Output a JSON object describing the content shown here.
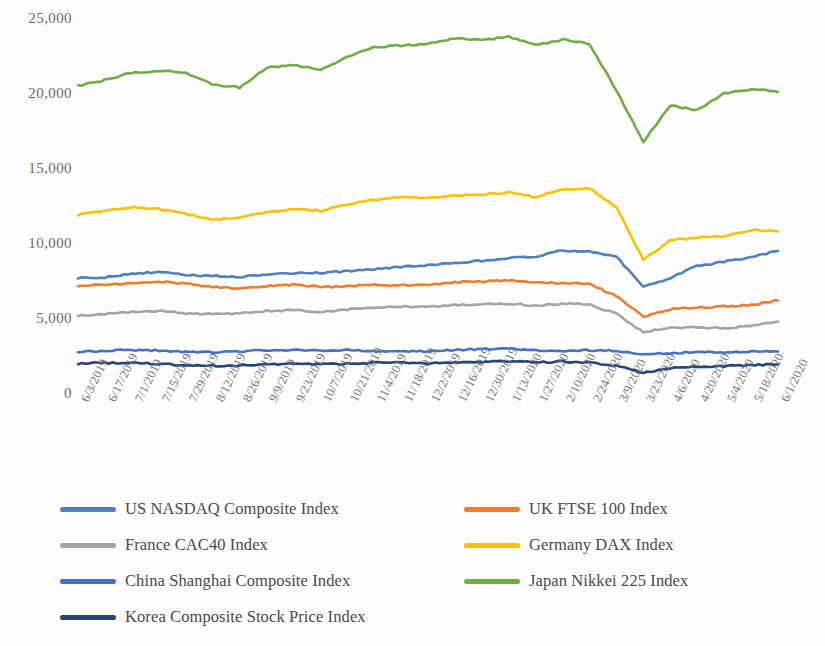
{
  "chart_data": {
    "type": "line",
    "title": "",
    "xlabel": "",
    "ylabel": "",
    "ylim": [
      0,
      25000
    ],
    "yticks": [
      0,
      5000,
      10000,
      15000,
      20000,
      25000
    ],
    "ytick_labels": [
      "0",
      "5,000",
      "10,000",
      "15,000",
      "20,000",
      "25,000"
    ],
    "grid": false,
    "legend_position": "bottom",
    "x": [
      "6/3/2019",
      "6/17/2019",
      "7/1/2019",
      "7/15/2019",
      "7/29/2019",
      "8/12/2019",
      "8/26/2019",
      "9/9/2019",
      "9/23/2019",
      "10/7/2019",
      "10/21/2019",
      "11/4/2019",
      "11/18/2019",
      "12/2/2019",
      "12/16/2019",
      "12/30/2019",
      "1/13/2020",
      "1/27/2020",
      "2/10/2020",
      "2/24/2020",
      "3/9/2020",
      "3/23/2020",
      "4/6/2020",
      "4/20/2020",
      "5/4/2020",
      "5/18/2020",
      "6/1/2020"
    ],
    "xtick_labels": [
      "6/3/2019",
      "6/17/2019",
      "7/1/2019",
      "7/15/2019",
      "7/29/2019",
      "8/12/2019",
      "8/26/2019",
      "9/9/2019",
      "9/23/2019",
      "10/7/2019",
      "10/21/2019",
      "11/4/2019",
      "11/18/2019",
      "12/2/2019",
      "12/16/2019",
      "12/30/2019",
      "1/13/2020",
      "1/27/2020",
      "2/10/2020",
      "2/24/2020",
      "3/9/2020",
      "3/23/2020",
      "4/6/2020",
      "4/20/2020",
      "5/4/2020",
      "5/18/2020",
      "6/1/2020"
    ],
    "series": [
      {
        "name": "US NASDAQ Composite Index",
        "color": "#4E81BD",
        "values": [
          7800,
          7850,
          8100,
          8200,
          8000,
          7950,
          7880,
          8050,
          8100,
          8150,
          8250,
          8400,
          8550,
          8650,
          8800,
          8950,
          9150,
          9200,
          9650,
          9550,
          9200,
          7200,
          7800,
          8600,
          8900,
          9200,
          9600
        ]
      },
      {
        "name": "UK FTSE 100 Index",
        "color": "#ED7D31",
        "values": [
          7300,
          7350,
          7450,
          7550,
          7450,
          7200,
          7100,
          7250,
          7350,
          7200,
          7250,
          7350,
          7300,
          7350,
          7520,
          7580,
          7620,
          7500,
          7450,
          7400,
          6600,
          5200,
          5700,
          5850,
          5900,
          6000,
          6300
        ]
      },
      {
        "name": "France CAC40 Index",
        "color": "#A5A5A5",
        "values": [
          5300,
          5400,
          5550,
          5600,
          5450,
          5380,
          5450,
          5600,
          5650,
          5550,
          5700,
          5850,
          5900,
          5880,
          6000,
          6050,
          6100,
          5950,
          6100,
          6050,
          5400,
          4200,
          4500,
          4500,
          4450,
          4600,
          4900
        ]
      },
      {
        "name": "Germany DAX Index",
        "color": "#FFC000",
        "values": [
          12000,
          12300,
          12500,
          12400,
          12100,
          11700,
          11800,
          12200,
          12400,
          12300,
          12700,
          13000,
          13200,
          13100,
          13300,
          13350,
          13500,
          13200,
          13700,
          13800,
          12500,
          9000,
          10300,
          10500,
          10600,
          11000,
          10900
        ]
      },
      {
        "name": "China Shanghai Composite Index",
        "color": "#4472C4",
        "values": [
          2900,
          2950,
          3000,
          2950,
          2900,
          2850,
          2900,
          3000,
          3000,
          2950,
          3000,
          2950,
          2900,
          2900,
          3000,
          3050,
          3100,
          2980,
          2900,
          3000,
          2950,
          2700,
          2800,
          2850,
          2870,
          2880,
          2900
        ]
      },
      {
        "name": "Japan Nikkei 225 Index",
        "color": "#70AD47",
        "values": [
          20600,
          21000,
          21500,
          21600,
          21500,
          20700,
          20500,
          21800,
          22000,
          21700,
          22500,
          23200,
          23300,
          23400,
          23800,
          23650,
          23900,
          23300,
          23700,
          23400,
          20300,
          16900,
          19300,
          19000,
          20100,
          20400,
          20200
        ]
      },
      {
        "name": "Korea Composite Stock Price Index",
        "color": "#264478",
        "values": [
          2100,
          2130,
          2130,
          2080,
          1990,
          1950,
          1960,
          2050,
          2080,
          2060,
          2080,
          2140,
          2160,
          2100,
          2180,
          2200,
          2230,
          2180,
          2230,
          2160,
          1950,
          1500,
          1800,
          1900,
          1920,
          1980,
          2050
        ]
      }
    ]
  },
  "legend": {
    "items": [
      {
        "label": "US NASDAQ Composite Index",
        "color": "#4E81BD"
      },
      {
        "label": "UK FTSE 100 Index",
        "color": "#ED7D31"
      },
      {
        "label": "France CAC40 Index",
        "color": "#A5A5A5"
      },
      {
        "label": "Germany DAX Index",
        "color": "#FFC000"
      },
      {
        "label": "China Shanghai Composite Index",
        "color": "#4472C4"
      },
      {
        "label": "Japan Nikkei 225 Index",
        "color": "#70AD47"
      },
      {
        "label": "Korea Composite Stock Price Index",
        "color": "#264478"
      }
    ]
  }
}
